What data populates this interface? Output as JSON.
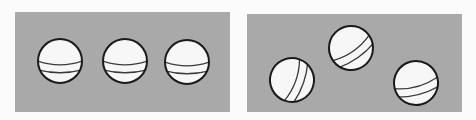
{
  "colors": {
    "page_background": "#fbfbfb",
    "panel_background": "#a9a9a9",
    "ball_fill": "#f7f7f7",
    "ball_outline": "#1a1a1a",
    "stripe": "#3a3a3a"
  },
  "panels": [
    {
      "name": "aligned-balls-panel",
      "x": 15,
      "y": 12,
      "width": 215,
      "height": 100,
      "balls": [
        {
          "cx": 60,
          "cy": 61,
          "r": 22,
          "rotation": 0
        },
        {
          "cx": 125,
          "cy": 61,
          "r": 22,
          "rotation": 0
        },
        {
          "cx": 187,
          "cy": 62,
          "r": 22,
          "rotation": 0
        }
      ]
    },
    {
      "name": "scattered-balls-panel",
      "x": 247,
      "y": 14,
      "width": 215,
      "height": 98,
      "balls": [
        {
          "cx": 292,
          "cy": 80,
          "r": 22,
          "rotation": -70
        },
        {
          "cx": 351,
          "cy": 48,
          "r": 22,
          "rotation": -35
        },
        {
          "cx": 416,
          "cy": 83,
          "r": 22,
          "rotation": -15
        }
      ]
    }
  ]
}
